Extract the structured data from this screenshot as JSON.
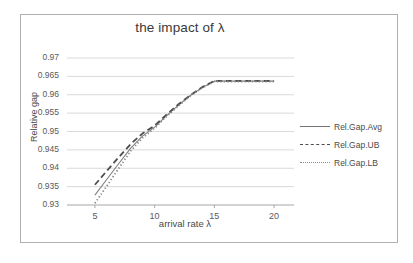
{
  "chart_data": {
    "type": "line",
    "title": "the impact of λ",
    "xlabel": "arrival rate  λ",
    "ylabel": "Relative gap",
    "grid": true,
    "legend_position": "right",
    "xlim": [
      3.5,
      21.5
    ],
    "ylim": [
      0.93,
      0.97
    ],
    "xticks": [
      5,
      10,
      15,
      20
    ],
    "xtick_labels": [
      "5",
      "10",
      "15",
      "20"
    ],
    "yticks": [
      0.93,
      0.935,
      0.94,
      0.945,
      0.95,
      0.955,
      0.96,
      0.965,
      0.97
    ],
    "ytick_labels": [
      "0.93",
      "0.935",
      "0.94",
      "0.945",
      "0.95",
      "0.955",
      "0.96",
      "0.965",
      "0.97"
    ],
    "x": [
      5,
      6,
      7,
      8,
      9,
      10,
      11,
      12,
      13,
      14,
      15,
      16,
      17,
      18,
      19,
      20
    ],
    "series": [
      {
        "name": "Rel.Gap.Avg",
        "style": "solid",
        "color": "#7f7f7f",
        "values": [
          0.9327,
          0.937,
          0.9413,
          0.9455,
          0.9488,
          0.9512,
          0.9543,
          0.9572,
          0.9598,
          0.962,
          0.9637,
          0.9637,
          0.9637,
          0.9637,
          0.9637,
          0.9637
        ]
      },
      {
        "name": "Rel.Gap.UB",
        "style": "dashed",
        "color": "#4d4d4d",
        "values": [
          0.9355,
          0.9393,
          0.943,
          0.9466,
          0.9495,
          0.9516,
          0.9546,
          0.9574,
          0.9599,
          0.9621,
          0.9638,
          0.9638,
          0.9638,
          0.9638,
          0.9638,
          0.9638
        ]
      },
      {
        "name": "Rel.Gap.LB",
        "style": "dotted",
        "color": "#8c8c8c",
        "values": [
          0.9305,
          0.9352,
          0.94,
          0.9447,
          0.9483,
          0.9509,
          0.9541,
          0.957,
          0.9597,
          0.9619,
          0.9636,
          0.9636,
          0.9636,
          0.9636,
          0.9636,
          0.9636
        ]
      }
    ]
  },
  "legend": {
    "items": [
      {
        "label": "Rel.Gap.Avg"
      },
      {
        "label": "Rel.Gap.UB"
      },
      {
        "label": "Rel.Gap.LB"
      }
    ]
  }
}
